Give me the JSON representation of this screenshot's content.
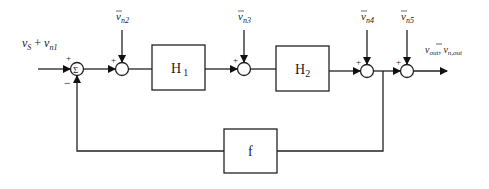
{
  "diagram": {
    "type": "block-diagram",
    "input_label": {
      "main": "v",
      "sub1": "S",
      "plus": " + ",
      "main2": "v",
      "sub2": "n1"
    },
    "noise_inputs": [
      {
        "id": "n2",
        "main": "v",
        "sub": "n2"
      },
      {
        "id": "n3",
        "main": "v",
        "sub": "n3"
      },
      {
        "id": "n4",
        "main": "v",
        "sub": "n4"
      },
      {
        "id": "n5",
        "main": "v",
        "sub": "n5"
      }
    ],
    "blocks": [
      {
        "id": "H1",
        "label": "H",
        "sub": "1"
      },
      {
        "id": "H2",
        "label": "H",
        "sub": "2"
      },
      {
        "id": "f",
        "label": "f"
      }
    ],
    "summing_junction": {
      "symbol": "Σ",
      "plus": "+",
      "minus": "−"
    },
    "adder_sign": "+",
    "output_label": {
      "main1": "v",
      "sub1": "out",
      "sep": ", ",
      "main2": "v",
      "sub2": "n,out"
    }
  }
}
